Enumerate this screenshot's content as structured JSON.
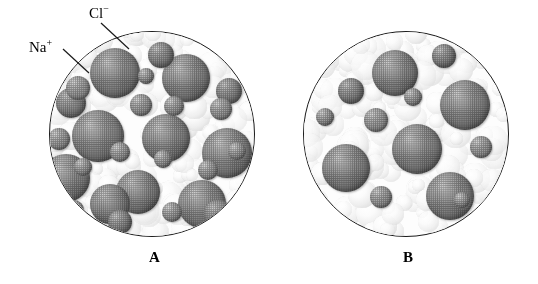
{
  "figure": {
    "background_color": "#ffffff",
    "line_color": "#1a1a1a"
  },
  "labels": {
    "chloride": {
      "text": "Cl",
      "charge": "−",
      "name": "chloride-ion-label"
    },
    "sodium": {
      "text": "Na",
      "charge": "+",
      "name": "sodium-ion-label"
    }
  },
  "captions": {
    "a": "A",
    "b": "B"
  },
  "legend_colors": {
    "chloride_ion": "#7d7d7d",
    "sodium_ion": "#8b8b8b",
    "water": "#ededed",
    "outline": "#1a1a1a"
  },
  "panels": [
    {
      "id": "circle-a",
      "caption": "A",
      "description": "concentrated sodium chloride solution",
      "center": {
        "x": 152,
        "y": 134
      },
      "radius": 103,
      "ion_counts": {
        "chloride": 14,
        "sodium": 13
      },
      "ions": [
        {
          "type": "cl",
          "x": 40,
          "y": 16,
          "d": 50
        },
        {
          "type": "cl",
          "x": 112,
          "y": 22,
          "d": 48
        },
        {
          "type": "cl",
          "x": 22,
          "y": 78,
          "d": 52
        },
        {
          "type": "cl",
          "x": 92,
          "y": 82,
          "d": 48
        },
        {
          "type": "cl",
          "x": 152,
          "y": 96,
          "d": 50
        },
        {
          "type": "cl",
          "x": -8,
          "y": 122,
          "d": 48
        },
        {
          "type": "cl",
          "x": 66,
          "y": 138,
          "d": 44
        },
        {
          "type": "cl",
          "x": 128,
          "y": 148,
          "d": 48
        },
        {
          "type": "cl",
          "x": 40,
          "y": 152,
          "d": 40
        },
        {
          "type": "cl",
          "x": 98,
          "y": 10,
          "d": 26
        },
        {
          "type": "cl",
          "x": 166,
          "y": 46,
          "d": 26
        },
        {
          "type": "cl",
          "x": 6,
          "y": 56,
          "d": 30
        },
        {
          "type": "cl",
          "x": 154,
          "y": 168,
          "d": 28
        },
        {
          "type": "cl",
          "x": 58,
          "y": 178,
          "d": 24
        },
        {
          "type": "na",
          "x": 16,
          "y": 44,
          "d": 24
        },
        {
          "type": "na",
          "x": 80,
          "y": 62,
          "d": 22
        },
        {
          "type": "na",
          "x": 114,
          "y": 64,
          "d": 20
        },
        {
          "type": "na",
          "x": 160,
          "y": 66,
          "d": 22
        },
        {
          "type": "na",
          "x": -2,
          "y": 96,
          "d": 22
        },
        {
          "type": "na",
          "x": 60,
          "y": 110,
          "d": 20
        },
        {
          "type": "na",
          "x": 104,
          "y": 118,
          "d": 18
        },
        {
          "type": "na",
          "x": 148,
          "y": 128,
          "d": 20
        },
        {
          "type": "na",
          "x": 24,
          "y": 126,
          "d": 18
        },
        {
          "type": "na",
          "x": 112,
          "y": 170,
          "d": 20
        },
        {
          "type": "na",
          "x": 14,
          "y": 168,
          "d": 20
        },
        {
          "type": "na",
          "x": 88,
          "y": 36,
          "d": 16
        },
        {
          "type": "na",
          "x": 178,
          "y": 110,
          "d": 18
        }
      ]
    },
    {
      "id": "circle-b",
      "caption": "B",
      "description": "dilute sodium chloride solution",
      "center": {
        "x": 406,
        "y": 134
      },
      "radius": 103,
      "ion_counts": {
        "chloride": 7,
        "sodium": 6
      },
      "ions": [
        {
          "type": "cl",
          "x": 68,
          "y": 18,
          "d": 46
        },
        {
          "type": "cl",
          "x": 136,
          "y": 48,
          "d": 50
        },
        {
          "type": "cl",
          "x": 88,
          "y": 92,
          "d": 50
        },
        {
          "type": "cl",
          "x": 18,
          "y": 112,
          "d": 48
        },
        {
          "type": "cl",
          "x": 122,
          "y": 140,
          "d": 48
        },
        {
          "type": "cl",
          "x": 128,
          "y": 12,
          "d": 24
        },
        {
          "type": "cl",
          "x": 34,
          "y": 46,
          "d": 26
        },
        {
          "type": "na",
          "x": 60,
          "y": 76,
          "d": 24
        },
        {
          "type": "na",
          "x": 166,
          "y": 104,
          "d": 22
        },
        {
          "type": "na",
          "x": 66,
          "y": 154,
          "d": 22
        },
        {
          "type": "na",
          "x": 100,
          "y": 56,
          "d": 18
        },
        {
          "type": "na",
          "x": 150,
          "y": 160,
          "d": 16
        },
        {
          "type": "na",
          "x": 12,
          "y": 76,
          "d": 18
        }
      ]
    }
  ],
  "leader_lines": [
    {
      "name": "chloride-leader-line",
      "x1": 101,
      "y1": 23,
      "x2": 129,
      "y2": 49
    },
    {
      "name": "sodium-leader-line",
      "x1": 63,
      "y1": 49,
      "x2": 89,
      "y2": 73
    }
  ]
}
